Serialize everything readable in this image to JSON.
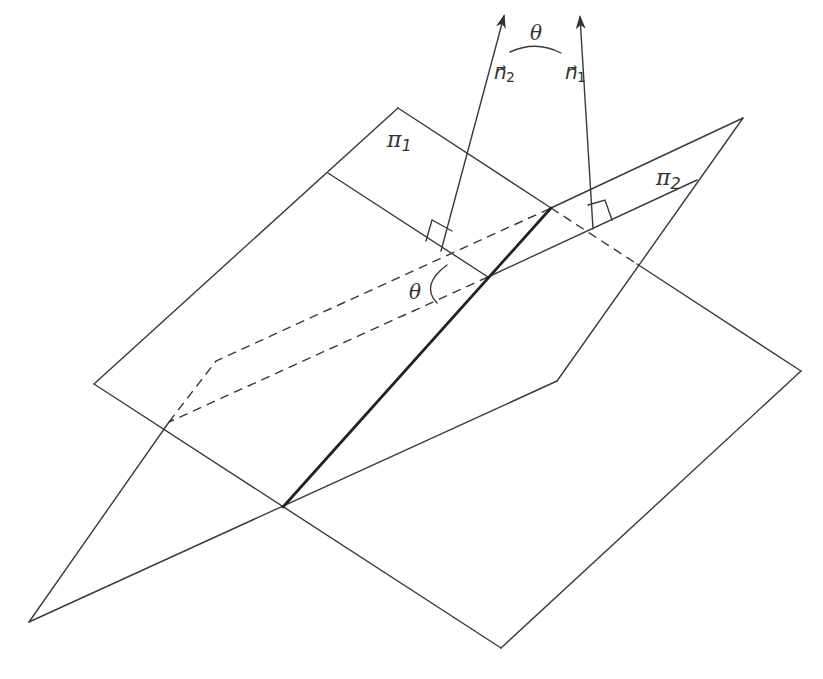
{
  "figure": {
    "planes": [
      {
        "name": "pi1",
        "symbol": "π",
        "subscript": "1"
      },
      {
        "name": "pi2",
        "symbol": "π",
        "subscript": "2"
      }
    ],
    "normals": [
      {
        "name": "n1",
        "symbol": "n",
        "arrow": "→",
        "subscript": "1"
      },
      {
        "name": "n2",
        "symbol": "n",
        "arrow": "→",
        "subscript": "2"
      }
    ],
    "angle_symbol": "θ",
    "colors": {
      "line": "#3a3a3a",
      "background": "#ffffff"
    }
  }
}
